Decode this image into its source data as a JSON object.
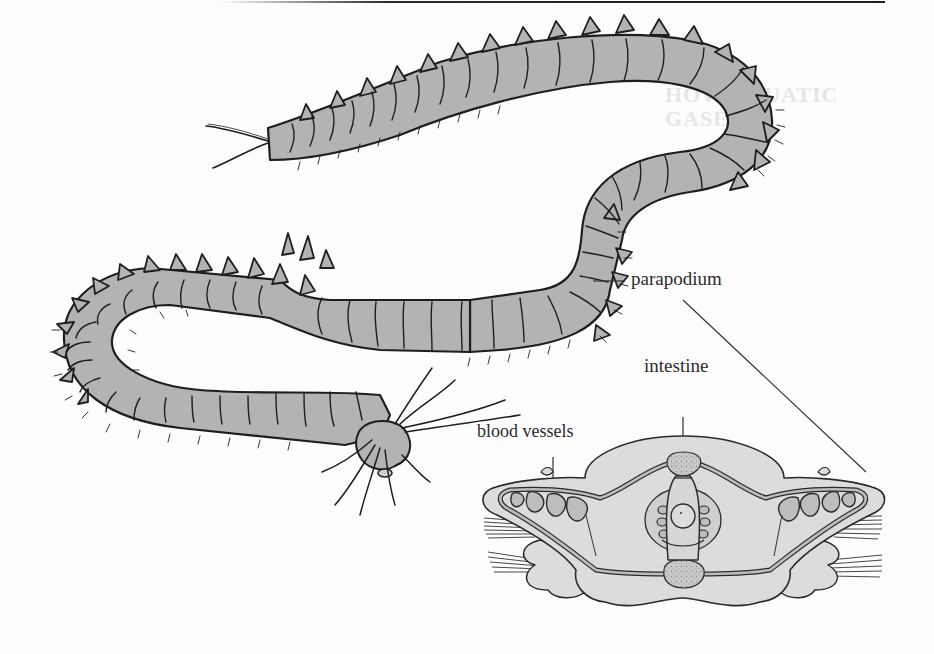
{
  "figure": {
    "labels": {
      "parapodium": "parapodium",
      "intestine": "intestine",
      "blood_vessels": "blood vessels"
    },
    "bleed_through": {
      "heading_line1": "HOW AQUATIC",
      "heading_line2": "GASES",
      "body_lines": [
        "Th   ni                                          the",
        "sing                                                   l of",
        "oxyg                                                  ls, al",
        "n w                                                     gen",
        "th    of",
        "th   ni",
        "ox                                                         n",
        "le",
        "wi                                                       ai",
        "ca"
      ]
    },
    "colors": {
      "body_fill": "#b3b3b3",
      "section_fill": "#dcdcdc",
      "vessel_fill": "#bdbdbd",
      "ink": "#1e1e1e",
      "label_ink": "#2b2b2b",
      "paper": "#fdfdfd"
    }
  }
}
